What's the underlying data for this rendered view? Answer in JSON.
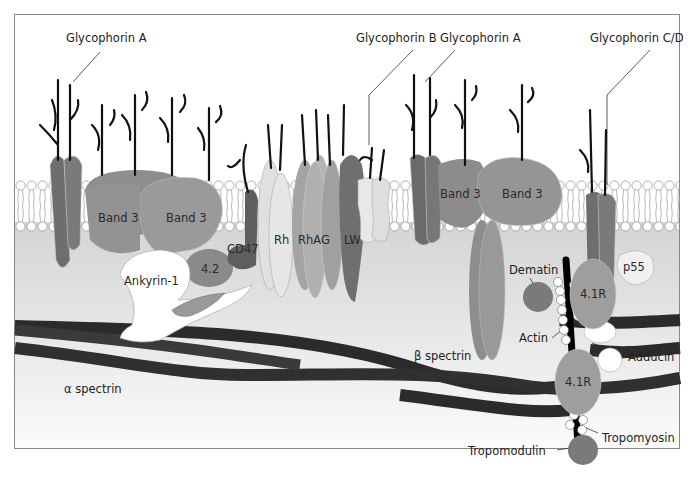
{
  "figure": {
    "title_labels": {
      "glycophorin_a_left": "Glycophorin A",
      "glycophorin_b": "Glycophorin B",
      "glycophorin_a_right": "Glycophorin A",
      "glycophorin_cd": "Glycophorin C/D"
    },
    "membrane_proteins": {
      "band3_1": "Band 3",
      "band3_2": "Band 3",
      "band3_3": "Band 3",
      "band3_4": "Band 3",
      "cd47": "CD47",
      "rh": "Rh",
      "rhag": "RhAG",
      "lw": "LW",
      "p55": "p55"
    },
    "cytoskeleton": {
      "ankyrin": "Ankyrin-1",
      "protein42": "4.2",
      "alpha_spectrin": "α spectrin",
      "beta_spectrin": "β spectrin",
      "dematin": "Dematin",
      "actin": "Actin",
      "adducin": "Adducin",
      "r41_top": "4.1R",
      "r41_bottom": "4.1R",
      "tropomyosin": "Tropomyosin",
      "tropomodulin": "Tropomodulin"
    },
    "colors": {
      "dark_protein": "#6e6e6e",
      "mid_protein": "#9a9a9a",
      "light_protein": "#d6d6d6",
      "cytoplasm": "#dcdcdc",
      "spectrin": "#2b2b2b",
      "glycan": "#111111"
    }
  }
}
